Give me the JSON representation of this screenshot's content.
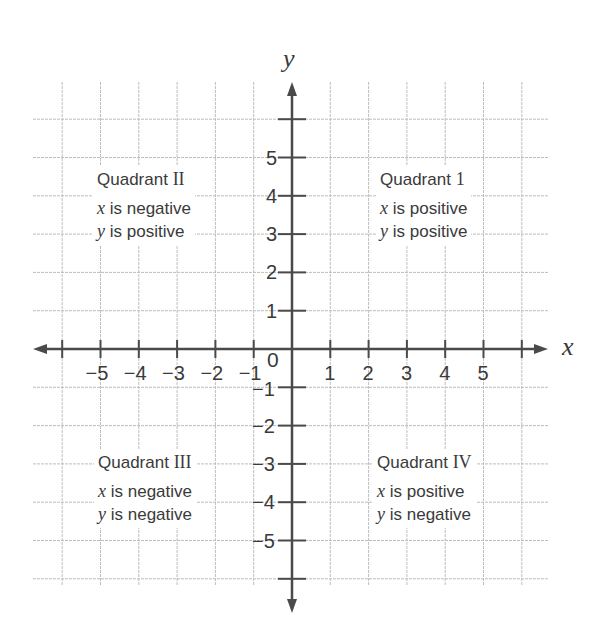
{
  "diagram": {
    "type": "coordinate-plane",
    "axes": {
      "x_label": "x",
      "y_label": "y",
      "origin_label": "0"
    },
    "x_ticks": [
      {
        "value": -5,
        "label": "−5"
      },
      {
        "value": -4,
        "label": "−4"
      },
      {
        "value": -3,
        "label": "−3"
      },
      {
        "value": -2,
        "label": "−2"
      },
      {
        "value": -1,
        "label": "−1"
      },
      {
        "value": 1,
        "label": "1"
      },
      {
        "value": 2,
        "label": "2"
      },
      {
        "value": 3,
        "label": "3"
      },
      {
        "value": 4,
        "label": "4"
      },
      {
        "value": 5,
        "label": "5"
      }
    ],
    "y_ticks": [
      {
        "value": 5,
        "label": "5"
      },
      {
        "value": 4,
        "label": "4"
      },
      {
        "value": 3,
        "label": "3"
      },
      {
        "value": 2,
        "label": "2"
      },
      {
        "value": 1,
        "label": "1"
      },
      {
        "value": -1,
        "label": "−1"
      },
      {
        "value": -2,
        "label": "−2"
      },
      {
        "value": -3,
        "label": "−3"
      },
      {
        "value": -4,
        "label": "−4"
      },
      {
        "value": -5,
        "label": "−5"
      }
    ],
    "grid": {
      "min": -6,
      "max": 6,
      "visible": true
    },
    "colors": {
      "axis": "#4a4a4a",
      "grid": "#bdbdbd",
      "text": "#3a3a3a",
      "background": "#ffffff"
    },
    "quadrants": {
      "q1": {
        "title_word": "Quadrant",
        "numeral": "1",
        "x_var": "x",
        "x_text": " is positive",
        "y_var": "y",
        "y_text": " is positive"
      },
      "q2": {
        "title_word": "Quadrant",
        "numeral": "II",
        "x_var": "x",
        "x_text": " is negative",
        "y_var": "y",
        "y_text": " is positive"
      },
      "q3": {
        "title_word": "Quadrant",
        "numeral": "III",
        "x_var": "x",
        "x_text": " is negative",
        "y_var": "y",
        "y_text": " is negative"
      },
      "q4": {
        "title_word": "Quadrant",
        "numeral": "IV",
        "x_var": "x",
        "x_text": " is positive",
        "y_var": "y",
        "y_text": " is negative"
      }
    }
  }
}
